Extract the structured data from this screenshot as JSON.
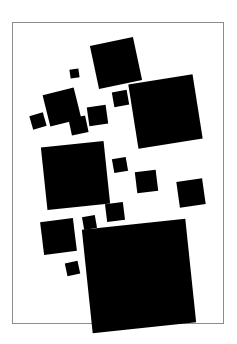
{
  "artwork": {
    "title": "Suprematist Composition of Black Squares",
    "medium": "black squares on white ground",
    "canvas": {
      "width": 237,
      "height": 344,
      "background": "#ffffff"
    },
    "frame": {
      "name": "picture-frame-border",
      "x": 12,
      "y": 22,
      "width": 212,
      "height": 302,
      "border_width": 1,
      "border_color": "#8c8c8c",
      "fill": "#ffffff"
    },
    "shape_color": "#000000",
    "shape_count": 17,
    "shapes": [
      {
        "id": "square-01",
        "label": "top-center large square",
        "x": 94,
        "y": 41,
        "size": 44,
        "rotation": -12
      },
      {
        "id": "square-02",
        "label": "tiny square upper-left-of-center",
        "x": 70,
        "y": 69,
        "size": 9,
        "rotation": -8
      },
      {
        "id": "square-03",
        "label": "medium square upper-left",
        "x": 46,
        "y": 91,
        "size": 32,
        "rotation": -14
      },
      {
        "id": "square-04",
        "label": "small square right of medium",
        "x": 113,
        "y": 91,
        "size": 15,
        "rotation": -10
      },
      {
        "id": "square-05",
        "label": "large right square",
        "x": 133,
        "y": 79,
        "size": 65,
        "rotation": -9
      },
      {
        "id": "square-06",
        "label": "tiny square far left",
        "x": 31,
        "y": 114,
        "size": 14,
        "rotation": -16
      },
      {
        "id": "square-07",
        "label": "small square center cluster left",
        "x": 70,
        "y": 117,
        "size": 17,
        "rotation": -12
      },
      {
        "id": "square-08",
        "label": "small square center cluster right",
        "x": 88,
        "y": 106,
        "size": 19,
        "rotation": -8
      },
      {
        "id": "square-09",
        "label": "large center-left square",
        "x": 44,
        "y": 144,
        "size": 63,
        "rotation": -6
      },
      {
        "id": "square-10",
        "label": "small square mid-right upper",
        "x": 113,
        "y": 158,
        "size": 14,
        "rotation": -10
      },
      {
        "id": "square-11",
        "label": "medium square mid-right",
        "x": 136,
        "y": 171,
        "size": 21,
        "rotation": -7
      },
      {
        "id": "square-12",
        "label": "medium square far right",
        "x": 178,
        "y": 180,
        "size": 26,
        "rotation": -8
      },
      {
        "id": "square-13",
        "label": "small square below center-left square",
        "x": 106,
        "y": 203,
        "size": 18,
        "rotation": -7
      },
      {
        "id": "square-14",
        "label": "small square left of bottom block",
        "x": 83,
        "y": 216,
        "size": 13,
        "rotation": -10
      },
      {
        "id": "square-15",
        "label": "medium square bottom-left",
        "x": 42,
        "y": 220,
        "size": 33,
        "rotation": -7
      },
      {
        "id": "square-16",
        "label": "tiny square lower-left",
        "x": 66,
        "y": 262,
        "size": 13,
        "rotation": -12
      },
      {
        "id": "square-17",
        "label": "large bottom square",
        "x": 87,
        "y": 224,
        "size": 104,
        "rotation": -6
      }
    ]
  }
}
